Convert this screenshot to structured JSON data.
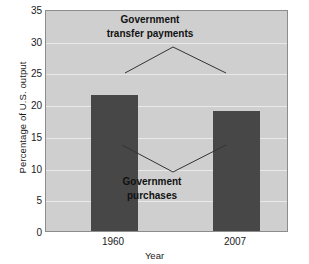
{
  "chart_data": {
    "type": "bar",
    "title": "",
    "categories": [
      "1960",
      "2007"
    ],
    "values": [
      21.7,
      19.1
    ],
    "xlabel": "Year",
    "ylabel": "Percentage of U.S. output",
    "ylim": [
      0,
      35
    ],
    "yticks": [
      0,
      5,
      10,
      15,
      20,
      25,
      30,
      35
    ],
    "ytick_labels": [
      "0",
      "5",
      "10",
      "15",
      "20",
      "25",
      "30",
      "35"
    ],
    "grid": true,
    "legend": "none",
    "annotations": [
      {
        "id": "transfer",
        "lines": [
          "Government",
          "transfer payments"
        ],
        "pointer": "inverted-v"
      },
      {
        "id": "purchases",
        "lines": [
          "Government",
          "purchases"
        ],
        "pointer": "v"
      }
    ],
    "colors": {
      "bar": "#474747",
      "plot_background": "#cfcfcf",
      "gridline": "#e9e9e9",
      "axis_border": "#8c8c8c",
      "text": "#1a1a1a",
      "leader_line": "#333333"
    }
  }
}
